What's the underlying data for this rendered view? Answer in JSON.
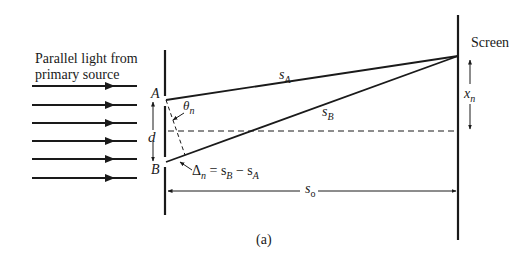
{
  "figure": {
    "caption": "(a)",
    "source_label_line1": "Parallel light from",
    "source_label_line2": "primary source",
    "screen_label": "Screen",
    "slit_a": "A",
    "slit_b": "B",
    "separation": "d",
    "angle": {
      "symbol": "θ",
      "sub": "n"
    },
    "path_a": {
      "symbol": "s",
      "sub": "A"
    },
    "path_b": {
      "symbol": "s",
      "sub": "B"
    },
    "fringe_position": {
      "symbol": "x",
      "sub": "n"
    },
    "screen_distance": {
      "symbol": "s",
      "sub": "o"
    },
    "path_difference": {
      "symbol": "Δ",
      "sub": "n",
      "equals": " = s",
      "sub_b": "B",
      "minus": " − s",
      "sub_a": "A"
    },
    "incident_ray_count": 6,
    "colors": {
      "ink": "#1a1a1a",
      "background": "#ffffff"
    }
  }
}
